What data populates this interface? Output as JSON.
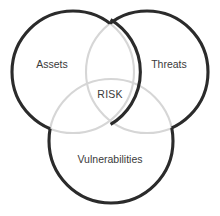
{
  "figure": {
    "type": "venn-diagram",
    "background_color": "#ffffff",
    "outline_color": "#2b2b2b",
    "inner_arc_color": "#d6d6d6",
    "text_color": "#3a3a3a",
    "set_count": 3
  },
  "sets": [
    {
      "id": "assets",
      "label": "Assets",
      "position": "left",
      "label_x": 52,
      "label_y": 65,
      "cx": 73,
      "cy": 72,
      "r": 61
    },
    {
      "id": "threats",
      "label": "Threats",
      "position": "right",
      "label_x": 169,
      "label_y": 65,
      "cx": 147,
      "cy": 72,
      "r": 61
    },
    {
      "id": "vulnerabilities",
      "label": "Vulnerabilities",
      "position": "bottom",
      "label_x": 110,
      "label_y": 160,
      "cx": 111,
      "cy": 141,
      "r": 62
    }
  ],
  "intersection": {
    "id": "risk",
    "label": "RISK",
    "label_x": 110,
    "label_y": 95,
    "description": "center intersection of all three sets"
  }
}
